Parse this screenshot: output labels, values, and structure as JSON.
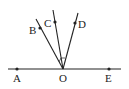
{
  "diagram": {
    "type": "geometry-rays",
    "line": {
      "from": "A",
      "to": "E",
      "through": "O"
    },
    "points": [
      {
        "label": "A",
        "x": 17,
        "y": 69,
        "lx": 13,
        "ly": 82
      },
      {
        "label": "O",
        "x": 63,
        "y": 69,
        "lx": 59,
        "ly": 82
      },
      {
        "label": "E",
        "x": 109,
        "y": 69,
        "lx": 105,
        "ly": 82
      },
      {
        "label": "B",
        "x": 40,
        "y": 28,
        "lx": 29,
        "ly": 34
      },
      {
        "label": "C",
        "x": 55,
        "y": 22,
        "lx": 44,
        "ly": 27
      },
      {
        "label": "D",
        "x": 75,
        "y": 23,
        "lx": 78,
        "ly": 28
      }
    ],
    "rays": [
      {
        "from": "O",
        "through": "B"
      },
      {
        "from": "O",
        "through": "C"
      },
      {
        "from": "O",
        "through": "D"
      }
    ],
    "color": "#222222"
  }
}
